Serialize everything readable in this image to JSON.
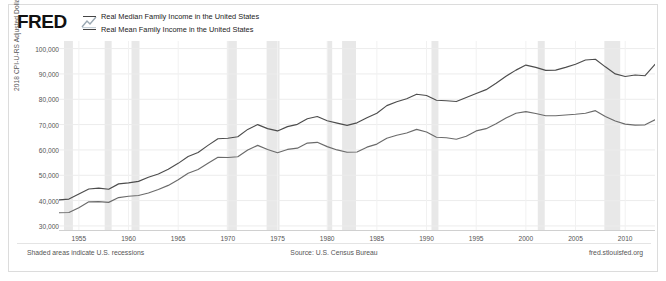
{
  "header": {
    "logo_text": "FRED",
    "logo_icon": "fred-swoosh-icon"
  },
  "legend": {
    "position": "top-left",
    "items": [
      {
        "label": "Real Median Family Income in the United States",
        "color": "#444444"
      },
      {
        "label": "Real Mean Family Income in the United States",
        "color": "#444444"
      }
    ]
  },
  "footer": {
    "left": "Shaded areas indicate U.S. recessions",
    "center": "Source: U.S. Census Bureau",
    "right": "fred.stlouisfed.org"
  },
  "chart_data": {
    "type": "line",
    "title": "",
    "xlabel": "",
    "ylabel": "2018 CPI-U-RS Adjusted Dollars",
    "xlim": [
      1953,
      2013
    ],
    "ylim": [
      28000,
      103000
    ],
    "grid": true,
    "yticks": [
      30000,
      40000,
      50000,
      60000,
      70000,
      80000,
      90000,
      100000
    ],
    "ytick_labels": [
      "30,000",
      "40,000",
      "50,000",
      "60,000",
      "70,000",
      "80,000",
      "90,000",
      "100,000"
    ],
    "xticks": [
      1955,
      1960,
      1965,
      1970,
      1975,
      1980,
      1985,
      1990,
      1995,
      2000,
      2005,
      2010
    ],
    "xtick_labels": [
      "1955",
      "1960",
      "1965",
      "1970",
      "1975",
      "1980",
      "1985",
      "1990",
      "1995",
      "2000",
      "2005",
      "2010"
    ],
    "recession_bands": [
      {
        "start": 1953.5,
        "end": 1954.4
      },
      {
        "start": 1957.6,
        "end": 1958.3
      },
      {
        "start": 1960.3,
        "end": 1961.1
      },
      {
        "start": 1969.9,
        "end": 1970.9
      },
      {
        "start": 1973.9,
        "end": 1975.2
      },
      {
        "start": 1980.0,
        "end": 1980.5
      },
      {
        "start": 1981.5,
        "end": 1982.9
      },
      {
        "start": 1990.5,
        "end": 1991.2
      },
      {
        "start": 2001.2,
        "end": 2001.9
      },
      {
        "start": 2007.9,
        "end": 2009.5
      }
    ],
    "x": [
      1953,
      1954,
      1955,
      1956,
      1957,
      1958,
      1959,
      1960,
      1961,
      1962,
      1963,
      1964,
      1965,
      1966,
      1967,
      1968,
      1969,
      1970,
      1971,
      1972,
      1973,
      1974,
      1975,
      1976,
      1977,
      1978,
      1979,
      1980,
      1981,
      1982,
      1983,
      1984,
      1985,
      1986,
      1987,
      1988,
      1989,
      1990,
      1991,
      1992,
      1993,
      1994,
      1995,
      1996,
      1997,
      1998,
      1999,
      2000,
      2001,
      2002,
      2003,
      2004,
      2005,
      2006,
      2007,
      2008,
      2009,
      2010,
      2011,
      2012,
      2013
    ],
    "series": [
      {
        "name": "Real Mean Family Income in the United States",
        "color": "#4d4d4d",
        "values": [
          40300,
          40600,
          42600,
          44600,
          44900,
          44500,
          46600,
          47000,
          47600,
          49200,
          50500,
          52400,
          54700,
          57400,
          59000,
          61800,
          64400,
          64600,
          65200,
          68100,
          70000,
          68400,
          67500,
          69200,
          70100,
          72300,
          73200,
          71500,
          70600,
          69700,
          70700,
          72700,
          74500,
          77500,
          79000,
          80200,
          82000,
          81500,
          79600,
          79400,
          79100,
          80700,
          82300,
          83800,
          86300,
          89100,
          91500,
          93500,
          92600,
          91400,
          91500,
          92600,
          93800,
          95500,
          95800,
          92800,
          90000,
          89000,
          89600,
          89300,
          93800
        ]
      },
      {
        "name": "Real Median Family Income in the United States",
        "color": "#6b6b6b",
        "values": [
          35200,
          35300,
          37200,
          39500,
          39600,
          39300,
          41200,
          41700,
          42000,
          43000,
          44400,
          46000,
          48200,
          50800,
          52300,
          54700,
          57100,
          57000,
          57300,
          60000,
          61800,
          60200,
          58900,
          60200,
          60700,
          62700,
          63000,
          61300,
          60000,
          59100,
          59200,
          61100,
          62300,
          64600,
          65800,
          66700,
          68100,
          67100,
          65000,
          64800,
          64200,
          65400,
          67500,
          68400,
          70300,
          72600,
          74500,
          75100,
          74400,
          73500,
          73500,
          73800,
          74100,
          74500,
          75500,
          73200,
          71400,
          70200,
          69800,
          69900,
          71900
        ]
      }
    ]
  }
}
